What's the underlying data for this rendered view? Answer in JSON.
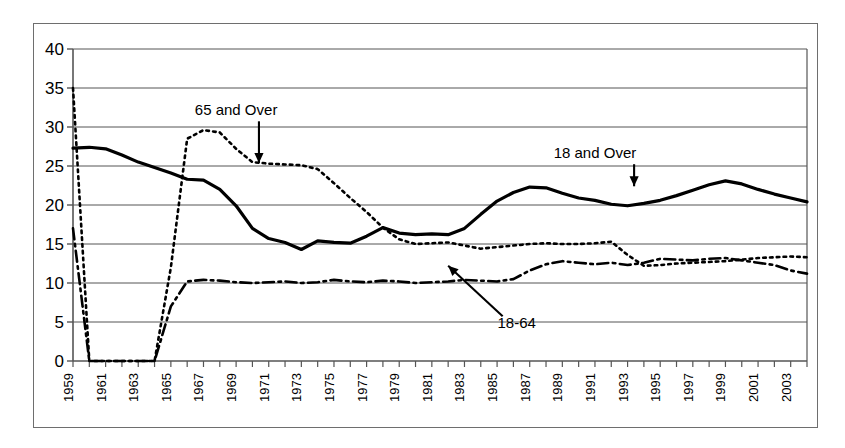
{
  "chart_data": {
    "type": "line",
    "title": "",
    "subtitle": "",
    "xlabel": "",
    "ylabel": "",
    "xlim": [
      1959,
      2004
    ],
    "ylim": [
      0,
      40
    ],
    "grid": true,
    "grid_axis": "y",
    "legend_position": "inline-annotations",
    "y_ticks": [
      0,
      5,
      10,
      15,
      20,
      25,
      30,
      35,
      40
    ],
    "y_tick_labels": [
      "0",
      "5",
      "10",
      "15",
      "20",
      "25",
      "30",
      "35",
      "40"
    ],
    "x_ticks": [
      1959,
      1960,
      1961,
      1962,
      1963,
      1964,
      1965,
      1966,
      1967,
      1968,
      1969,
      1970,
      1971,
      1972,
      1973,
      1974,
      1975,
      1976,
      1977,
      1978,
      1979,
      1980,
      1981,
      1982,
      1983,
      1984,
      1985,
      1986,
      1987,
      1988,
      1989,
      1990,
      1991,
      1992,
      1993,
      1994,
      1995,
      1996,
      1997,
      1998,
      1999,
      2000,
      2001,
      2002,
      2003,
      2004
    ],
    "x_tick_labels": [
      "1959",
      "1961",
      "1963",
      "1965",
      "1967",
      "1969",
      "1971",
      "1973",
      "1975",
      "1977",
      "1979",
      "1981",
      "1983",
      "1985",
      "1987",
      "1989",
      "1991",
      "1993",
      "1995",
      "1997",
      "1999",
      "2001",
      "2003"
    ],
    "x_tick_label_years": [
      1959,
      1961,
      1963,
      1965,
      1967,
      1969,
      1971,
      1973,
      1975,
      1977,
      1979,
      1981,
      1983,
      1985,
      1987,
      1989,
      1991,
      1993,
      1995,
      1997,
      1999,
      2001,
      2003
    ],
    "x_tick_label_rotation": -90,
    "x": [
      1959,
      1960,
      1961,
      1962,
      1963,
      1964,
      1965,
      1966,
      1967,
      1968,
      1969,
      1970,
      1971,
      1972,
      1973,
      1974,
      1975,
      1976,
      1977,
      1978,
      1979,
      1980,
      1981,
      1982,
      1983,
      1984,
      1985,
      1986,
      1987,
      1988,
      1989,
      1990,
      1991,
      1992,
      1993,
      1994,
      1995,
      1996,
      1997,
      1998,
      1999,
      2000,
      2001,
      2002,
      2003,
      2004
    ],
    "series": [
      {
        "name": "18 and Over",
        "style": "solid",
        "color": "#000000",
        "width": 3.2,
        "values": [
          27.3,
          27.4,
          27.2,
          26.4,
          25.5,
          24.8,
          24.1,
          23.3,
          23.2,
          22.0,
          19.9,
          17.0,
          15.7,
          15.2,
          14.3,
          15.4,
          15.2,
          15.1,
          16.0,
          17.1,
          16.4,
          16.2,
          16.3,
          16.2,
          17.0,
          18.8,
          20.5,
          21.6,
          22.3,
          22.2,
          21.5,
          20.9,
          20.6,
          20.1,
          19.9,
          20.2,
          20.6,
          21.2,
          21.9,
          22.6,
          23.1,
          22.7,
          22.0,
          21.4,
          20.9,
          20.4
        ],
        "values_tail": [
          19.5,
          18.2,
          17.2,
          16.5,
          16.3,
          16.6,
          17.2,
          17.6,
          17.9,
          18.2
        ]
      },
      {
        "name": "65 and Over",
        "style": "dotted",
        "color": "#000000",
        "width": 2.6,
        "values": [
          35.0,
          0,
          0,
          0,
          0,
          0,
          12.0,
          28.5,
          29.6,
          29.3,
          27.2,
          25.5,
          25.3,
          25.2,
          25.1,
          24.6,
          22.8,
          20.9,
          19.1,
          17.1,
          15.6,
          15.0,
          15.1,
          15.2,
          14.8,
          14.4,
          14.6,
          14.8,
          15.0,
          15.1,
          15.0,
          15.0,
          15.1,
          15.3,
          13.6,
          12.2,
          12.3,
          12.5,
          12.6,
          12.7,
          12.8,
          13.0,
          13.2,
          13.3,
          13.4,
          13.3
        ],
        "gap_years": [
          1960,
          1961,
          1962,
          1963,
          1964
        ]
      },
      {
        "name": "18-64",
        "style": "dashdot",
        "color": "#000000",
        "width": 2.6,
        "values": [
          17.0,
          0,
          0,
          0,
          0,
          0,
          7.0,
          10.2,
          10.4,
          10.3,
          10.1,
          10.0,
          10.1,
          10.2,
          10.0,
          10.1,
          10.4,
          10.2,
          10.1,
          10.3,
          10.2,
          10.0,
          10.1,
          10.2,
          10.4,
          10.3,
          10.2,
          10.5,
          11.6,
          12.4,
          12.8,
          12.6,
          12.4,
          12.6,
          12.3,
          12.6,
          13.1,
          13.0,
          12.9,
          13.1,
          13.2,
          12.9,
          12.6,
          12.3,
          11.6,
          11.2
        ],
        "gap_years": [
          1960,
          1961,
          1962,
          1963,
          1964
        ]
      }
    ],
    "annotations": [
      {
        "text": "65 and Over",
        "x": 1969.0,
        "y": 31.5,
        "arrow_to_x": 1970.4,
        "arrow_to_y": 25.4,
        "arrow": "down"
      },
      {
        "text": "18 and Over",
        "x": 1991.0,
        "y": 26.0,
        "arrow_to_x": 1993.4,
        "arrow_to_y": 22.4,
        "arrow": "down"
      },
      {
        "text": "18-64",
        "x": 1986.2,
        "y": 4.2,
        "arrow_to_x": 1982.0,
        "arrow_to_y": 12.2,
        "arrow": "up-left"
      }
    ]
  },
  "figure": {
    "border_color": "#6e6e6e",
    "background": "#ffffff",
    "axis_color": "#555555",
    "grid_color": "#555555"
  }
}
